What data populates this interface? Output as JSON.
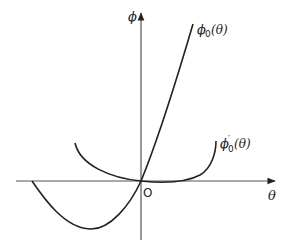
{
  "figure": {
    "type": "function-plot-sketch",
    "axes": {
      "x_label": "θ",
      "y_label": "ϕ",
      "origin_label": "O"
    },
    "curves": [
      {
        "name": "phi0",
        "label_main": "ϕ",
        "label_sub": "0",
        "label_arg": " (θ)",
        "description": "starts on negative θ-axis, dips to a minimum below the axis, passes through origin, rises steeply"
      },
      {
        "name": "phi0-prime",
        "label_main": "ϕ",
        "label_prime": "′",
        "label_sub": "0",
        "label_arg": " (θ)",
        "description": "U-shaped curve, positive on both sides, flat near origin"
      }
    ],
    "colors": {
      "line": "#222222",
      "background": "#ffffff"
    }
  }
}
